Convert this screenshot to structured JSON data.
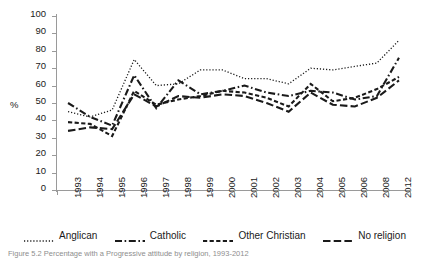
{
  "chart_data": {
    "type": "line",
    "title": "",
    "xlabel": "",
    "ylabel": "%",
    "ylim": [
      0,
      100
    ],
    "ytick_step": 10,
    "yticks": [
      100,
      90,
      80,
      70,
      60,
      50,
      40,
      30,
      20,
      10,
      0
    ],
    "grid": false,
    "legend_position": "bottom",
    "categories": [
      "1993",
      "1994",
      "1995",
      "1996",
      "1997",
      "1998",
      "1999",
      "2000",
      "2001",
      "2002",
      "2003",
      "2004",
      "2005",
      "2006",
      "2008",
      "2012"
    ],
    "series": [
      {
        "name": "Anglican",
        "line_style": "dotted",
        "color": "#1a1a1a",
        "values": [
          45,
          42,
          46,
          75,
          60,
          61,
          69,
          69,
          64,
          64,
          61,
          70,
          69,
          71,
          73,
          86
        ]
      },
      {
        "name": "Catholic",
        "line_style": "dash-dot",
        "color": "#1a1a1a",
        "values": [
          50,
          42,
          37,
          66,
          47,
          63,
          55,
          57,
          60,
          56,
          54,
          57,
          56,
          52,
          54,
          76
        ]
      },
      {
        "name": "Other Christian",
        "line_style": "dashed-short",
        "color": "#1a1a1a",
        "values": [
          39,
          38,
          31,
          57,
          49,
          52,
          54,
          57,
          56,
          53,
          48,
          61,
          51,
          53,
          58,
          65
        ]
      },
      {
        "name": "No religion",
        "line_style": "dashed-long",
        "color": "#1a1a1a",
        "values": [
          34,
          36,
          35,
          55,
          48,
          54,
          53,
          55,
          54,
          50,
          45,
          56,
          49,
          48,
          53,
          63
        ]
      }
    ]
  },
  "legend": {
    "items": [
      {
        "label": "Anglican",
        "style": "dotted"
      },
      {
        "label": "Catholic",
        "style": "dash-dot"
      },
      {
        "label": "Other Christian",
        "style": "dashed-short"
      },
      {
        "label": "No religion",
        "style": "dashed-long"
      }
    ]
  },
  "caption": {
    "text": "Figure 5.2   Percentage with a Progressive attitude by religion, 1993-2012"
  }
}
